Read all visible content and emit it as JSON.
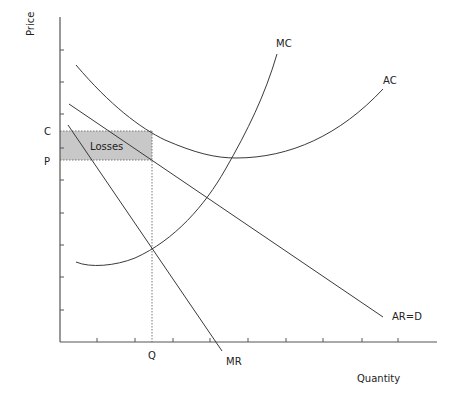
{
  "diagram": {
    "title": "",
    "axes": {
      "y_label": "Price",
      "x_label": "Quantity",
      "y_ticks_px": [
        50,
        82,
        114,
        148,
        180,
        213,
        245,
        277,
        310
      ],
      "x_ticks_px": [
        97,
        135,
        173,
        210,
        248,
        286,
        323,
        362,
        398
      ]
    },
    "price_labels": {
      "c": "C",
      "p": "P"
    },
    "quantity_labels": {
      "q": "Q"
    },
    "shaded_area": {
      "label": "Losses",
      "fill": "#c8c8c8"
    },
    "curves": {
      "mc": "MC",
      "ac": "AC",
      "ar": "AR=D",
      "mr": "MR"
    },
    "colors": {
      "line": "#3a3a3a",
      "axis": "#555555",
      "background": "#ffffff"
    }
  }
}
